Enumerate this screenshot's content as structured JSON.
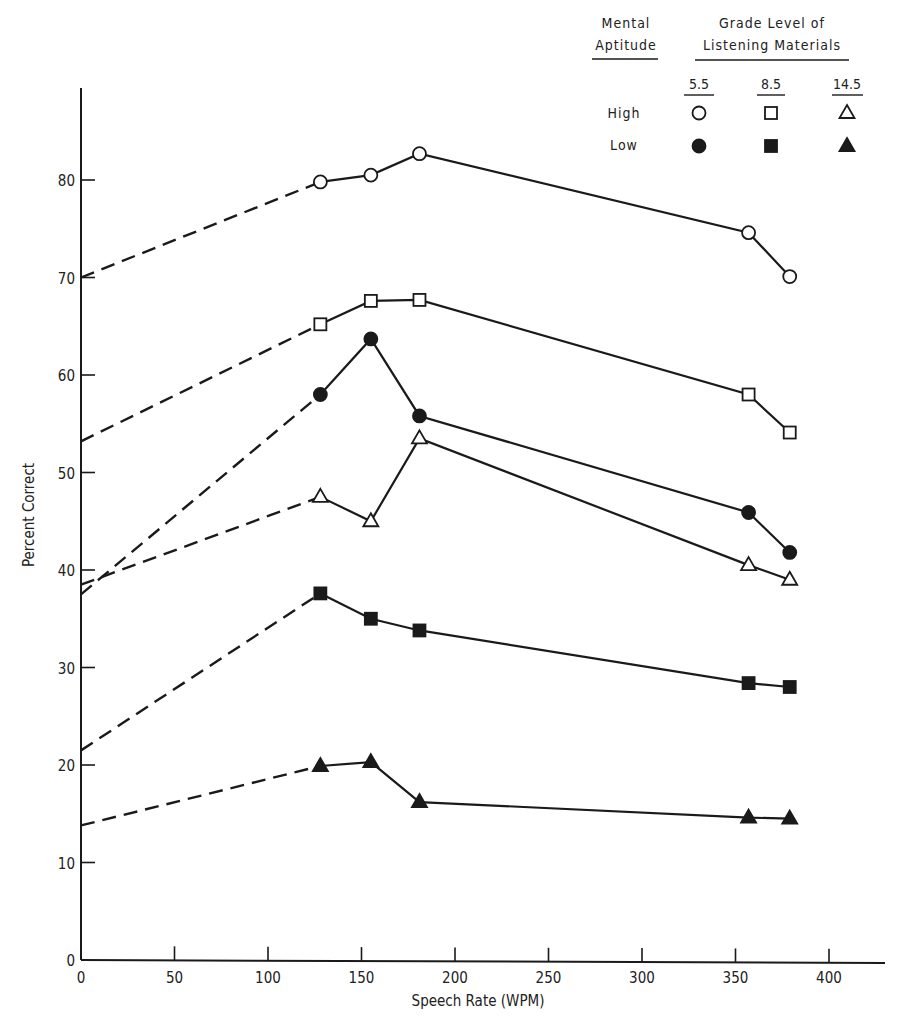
{
  "chart_data": {
    "type": "line",
    "title": "",
    "xlabel": "Speech Rate (WPM)",
    "ylabel": "Percent Correct",
    "xlim": [
      0,
      430
    ],
    "ylim": [
      0,
      90
    ],
    "x_ticks": [
      0,
      50,
      100,
      150,
      200,
      250,
      300,
      350,
      400
    ],
    "y_ticks": [
      0,
      10,
      20,
      30,
      40,
      50,
      60,
      70,
      80
    ],
    "grid": false,
    "legend_position": "top-right",
    "legend": {
      "row_header": "Mental Aptitude",
      "col_header": "Grade Level of Listening Materials",
      "columns": [
        "5.5",
        "8.5",
        "14.5"
      ],
      "rows": [
        "High",
        "Low"
      ]
    },
    "x": [
      128,
      155,
      181,
      357,
      379
    ],
    "series": [
      {
        "name": "High aptitude, grade 5.5",
        "aptitude": "High",
        "grade": "5.5",
        "marker": "circle",
        "filled": false,
        "values": [
          79.8,
          80.5,
          82.7,
          74.6,
          70.1
        ],
        "extrapolated_intercept": 70.0
      },
      {
        "name": "High aptitude, grade 8.5",
        "aptitude": "High",
        "grade": "8.5",
        "marker": "square",
        "filled": false,
        "values": [
          65.2,
          67.6,
          67.7,
          58.0,
          54.1
        ],
        "extrapolated_intercept": 53.2
      },
      {
        "name": "Low aptitude, grade 5.5",
        "aptitude": "Low",
        "grade": "5.5",
        "marker": "circle",
        "filled": true,
        "values": [
          58.0,
          63.7,
          55.8,
          45.9,
          41.8
        ],
        "extrapolated_intercept": 37.5
      },
      {
        "name": "High aptitude, grade 14.5",
        "aptitude": "High",
        "grade": "14.5",
        "marker": "triangle",
        "filled": false,
        "values": [
          47.5,
          45.0,
          53.5,
          40.5,
          39.0
        ],
        "extrapolated_intercept": 38.5
      },
      {
        "name": "Low aptitude, grade 8.5",
        "aptitude": "Low",
        "grade": "8.5",
        "marker": "square",
        "filled": true,
        "values": [
          37.6,
          35.0,
          33.8,
          28.4,
          28.0
        ],
        "extrapolated_intercept": 21.5
      },
      {
        "name": "Low aptitude, grade 14.5",
        "aptitude": "Low",
        "grade": "14.5",
        "marker": "triangle",
        "filled": true,
        "values": [
          19.9,
          20.3,
          16.2,
          14.6,
          14.5
        ],
        "extrapolated_intercept": 13.8
      }
    ],
    "annotations": [
      "Dashed lines extrapolate each series from first data point back to 0 WPM"
    ]
  },
  "labels": {
    "xlabel": "Speech Rate (WPM)",
    "ylabel": "Percent Correct",
    "legend_row_header_1": "Mental",
    "legend_row_header_2": "Aptitude",
    "legend_col_header_1": "Grade Level of",
    "legend_col_header_2": "Listening Materials",
    "legend_col_1": "5.5",
    "legend_col_2": "8.5",
    "legend_col_3": "14.5",
    "legend_row_1": "High",
    "legend_row_2": "Low"
  },
  "colors": {
    "ink": "#1a1a1a",
    "background": "#ffffff"
  }
}
